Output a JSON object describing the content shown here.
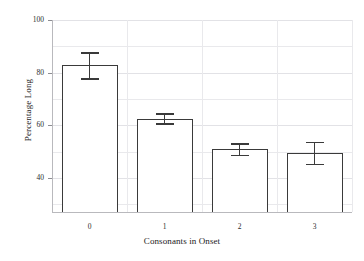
{
  "chart_data": {
    "type": "bar",
    "title": "",
    "subtitle": "",
    "xlabel": "Consonants in Onset",
    "ylabel": "Percentage Long",
    "categories": [
      "0",
      "1",
      "2",
      "3"
    ],
    "values": [
      83.0,
      62.5,
      51.0,
      49.5
    ],
    "errors_upper": [
      87.8,
      64.5,
      53.2,
      53.8
    ],
    "errors_lower": [
      77.8,
      60.8,
      48.8,
      45.3
    ],
    "error_label": "error bars",
    "ylim": [
      27.1,
      100
    ],
    "xlim": [
      -0.5,
      3.5
    ],
    "ytick_labels": [
      "100",
      "80",
      "60",
      "40"
    ],
    "ytick_values": [
      100,
      80,
      60,
      40
    ],
    "yminor_values": [
      90,
      70,
      50,
      30
    ],
    "xtick_labels": [
      "0",
      "1",
      "2",
      "3"
    ],
    "grid": true,
    "grid_axis": "both",
    "legend": false,
    "legend_position": "none",
    "bar_facecolor": "#ffffff",
    "bar_edgecolor": "#3a3a3a",
    "grid_color": "#e9e9ec",
    "axis_color": "#b9b9bd",
    "text_color": "#1a1a1a",
    "background": "#ffffff"
  }
}
